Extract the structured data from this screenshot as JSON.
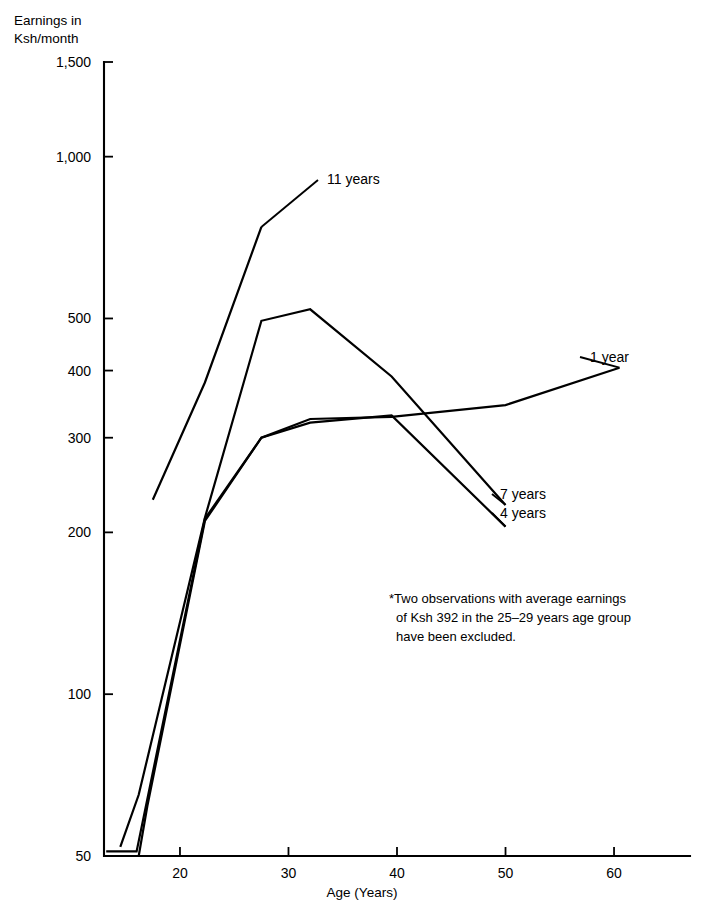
{
  "chart_data": {
    "type": "line",
    "title": "",
    "ylabel": "Earnings in Ksh/month",
    "ylabel_line1": "Earnings in",
    "ylabel_line2": "Ksh/month",
    "xlabel": "Age (Years)",
    "yscale": "log",
    "ylim": [
      50,
      1500
    ],
    "xlim": [
      13,
      67
    ],
    "grid": false,
    "legend_position": "inline-line-labels",
    "yticks": [
      50,
      100,
      200,
      300,
      400,
      500,
      1000,
      1500
    ],
    "ytick_labels": [
      "50",
      "100",
      "200",
      "300",
      "400",
      "500",
      "1,000",
      "1,500"
    ],
    "xticks": [
      20,
      30,
      40,
      50,
      60
    ],
    "xtick_labels": [
      "20",
      "30",
      "40",
      "50",
      "60"
    ],
    "series": [
      {
        "name": "11 years",
        "label": "11 years",
        "x": [
          17.5,
          22.3,
          27.5
        ],
        "values": [
          230,
          380,
          740
        ]
      },
      {
        "name": "7 years",
        "label": "7 years",
        "x": [
          14.5,
          16.2,
          22.3,
          27.5,
          32,
          39.5,
          50
        ],
        "values": [
          52,
          65,
          213,
          495,
          520,
          390,
          225
        ]
      },
      {
        "name": "4 years",
        "label": "4 years",
        "x": [
          16.2,
          17.0,
          22.3,
          27.5,
          32,
          39.5,
          50
        ],
        "values": [
          50,
          62,
          210,
          300,
          320,
          330,
          205
        ]
      },
      {
        "name": "1 year",
        "label": "1 year",
        "x": [
          13.2,
          16.0,
          22.3,
          27.5,
          32,
          39.5,
          50,
          60.5
        ],
        "values": [
          51,
          51,
          212,
          300,
          325,
          328,
          345,
          405
        ]
      }
    ],
    "annotations": [
      {
        "name": "footnote",
        "lines": [
          "*Two observations with average earnings",
          "of Ksh 392 in the 25–29 years age group",
          "have been excluded."
        ]
      }
    ]
  },
  "colors": {
    "line": "#000000",
    "axis": "#000000",
    "background": "#ffffff"
  }
}
